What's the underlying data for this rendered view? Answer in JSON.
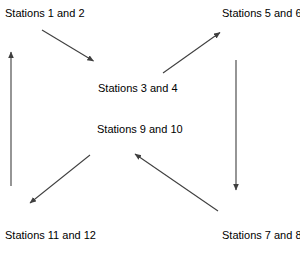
{
  "diagram": {
    "type": "cycle-flow-diagram",
    "stroke_color": "#3f3f3f",
    "text_color": "#000000",
    "background_color": "#ffffff",
    "nodes": [
      {
        "id": "stations-1-2",
        "label": "Stations 1 and 2"
      },
      {
        "id": "stations-5-6",
        "label": "Stations 5 and 6"
      },
      {
        "id": "stations-3-4",
        "label": "Stations 3 and 4"
      },
      {
        "id": "stations-9-10",
        "label": "Stations 9 and 10"
      },
      {
        "id": "stations-11-12",
        "label": "Stations 11 and 12"
      },
      {
        "id": "stations-7-8",
        "label": "Stations 7 and 8"
      }
    ],
    "arrows": [
      {
        "id": "arrow-1-2-to-3-4",
        "from": "stations-1-2",
        "to": "stations-3-4",
        "direction": "down-right"
      },
      {
        "id": "arrow-3-4-to-5-6",
        "from": "stations-3-4",
        "to": "stations-5-6",
        "direction": "up-right"
      },
      {
        "id": "arrow-5-6-to-7-8",
        "from": "stations-5-6",
        "to": "stations-7-8",
        "direction": "down"
      },
      {
        "id": "arrow-7-8-to-9-10",
        "from": "stations-7-8",
        "to": "stations-9-10",
        "direction": "up-left"
      },
      {
        "id": "arrow-9-10-to-11-12",
        "from": "stations-9-10",
        "to": "stations-11-12",
        "direction": "down-left"
      },
      {
        "id": "arrow-11-12-to-1-2",
        "from": "stations-11-12",
        "to": "stations-1-2",
        "direction": "up"
      }
    ]
  }
}
